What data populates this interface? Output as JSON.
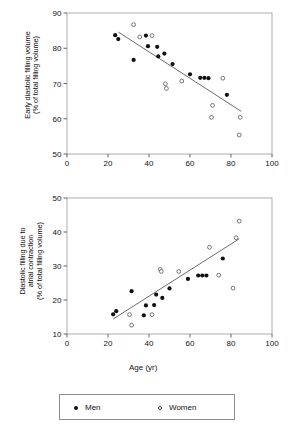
{
  "figure": {
    "xlabel": "Age (yr)",
    "legend": {
      "men_label": "Men",
      "women_label": "Women",
      "men_marker": "filled-circle",
      "women_marker": "open-circle"
    }
  },
  "chart_data": [
    {
      "id": "early-diastolic-filling-volume",
      "type": "scatter",
      "title": "",
      "xlabel": "Age (yr)",
      "ylabel_line1": "Early diastolic filling volume",
      "ylabel_line2": "(% of total filling volume)",
      "xlim": [
        0,
        100
      ],
      "ylim": [
        50,
        90
      ],
      "xticks": [
        0,
        20,
        40,
        60,
        80,
        100
      ],
      "yticks": [
        50,
        60,
        70,
        80,
        90
      ],
      "grid": false,
      "legend_position": "below-figure",
      "series": [
        {
          "name": "Men",
          "marker": "filled-circle",
          "points": [
            [
              23.5,
              83.7
            ],
            [
              25.0,
              82.6
            ],
            [
              32.5,
              76.7
            ],
            [
              38.5,
              83.6
            ],
            [
              39.5,
              80.6
            ],
            [
              44.0,
              80.4
            ],
            [
              44.5,
              77.7
            ],
            [
              47.5,
              78.5
            ],
            [
              51.5,
              75.5
            ],
            [
              60.0,
              72.6
            ],
            [
              65.0,
              71.6
            ],
            [
              67.0,
              71.6
            ],
            [
              69.0,
              71.5
            ],
            [
              78.0,
              66.8
            ]
          ]
        },
        {
          "name": "Women",
          "marker": "open-circle",
          "points": [
            [
              32.5,
              86.7
            ],
            [
              35.5,
              83.2
            ],
            [
              41.5,
              83.6
            ],
            [
              48.0,
              69.9
            ],
            [
              48.5,
              68.6
            ],
            [
              56.0,
              70.7
            ],
            [
              76.0,
              71.5
            ],
            [
              71.0,
              63.8
            ],
            [
              70.5,
              60.4
            ],
            [
              84.5,
              60.4
            ],
            [
              84.0,
              55.4
            ]
          ]
        }
      ],
      "regression_line": {
        "x_start": 25.0,
        "y_start": 84.6,
        "x_end": 85.0,
        "y_end": 62.1
      }
    },
    {
      "id": "diastolic-filling-atrial-contraction",
      "type": "scatter",
      "title": "",
      "xlabel": "Age (yr)",
      "ylabel_line1": "Diastolic filling due to",
      "ylabel_line2": "atrial contraction",
      "ylabel_line3": "(% of total filling volume)",
      "xlim": [
        0,
        100
      ],
      "ylim": [
        10,
        50
      ],
      "xticks": [
        0,
        20,
        40,
        60,
        80,
        100
      ],
      "yticks": [
        10,
        20,
        30,
        40,
        50
      ],
      "grid": false,
      "legend_position": "below-figure",
      "series": [
        {
          "name": "Men",
          "marker": "filled-circle",
          "points": [
            [
              22.5,
              15.8
            ],
            [
              24.0,
              16.7
            ],
            [
              31.5,
              22.6
            ],
            [
              37.5,
              15.5
            ],
            [
              38.5,
              18.4
            ],
            [
              42.5,
              18.5
            ],
            [
              43.5,
              21.6
            ],
            [
              46.5,
              20.6
            ],
            [
              50.0,
              23.4
            ],
            [
              59.0,
              26.2
            ],
            [
              64.0,
              27.2
            ],
            [
              66.0,
              27.2
            ],
            [
              68.0,
              27.2
            ],
            [
              76.0,
              32.2
            ]
          ]
        },
        {
          "name": "Women",
          "marker": "open-circle",
          "points": [
            [
              30.5,
              15.7
            ],
            [
              31.5,
              12.6
            ],
            [
              41.5,
              15.7
            ],
            [
              45.5,
              29.0
            ],
            [
              46.0,
              28.4
            ],
            [
              54.5,
              28.4
            ],
            [
              69.5,
              35.5
            ],
            [
              74.0,
              27.3
            ],
            [
              81.0,
              23.5
            ],
            [
              82.5,
              38.3
            ],
            [
              84.0,
              43.2
            ]
          ]
        }
      ],
      "regression_line": {
        "x_start": 22.5,
        "y_start": 14.4,
        "x_end": 84.0,
        "y_end": 38.0
      }
    }
  ]
}
